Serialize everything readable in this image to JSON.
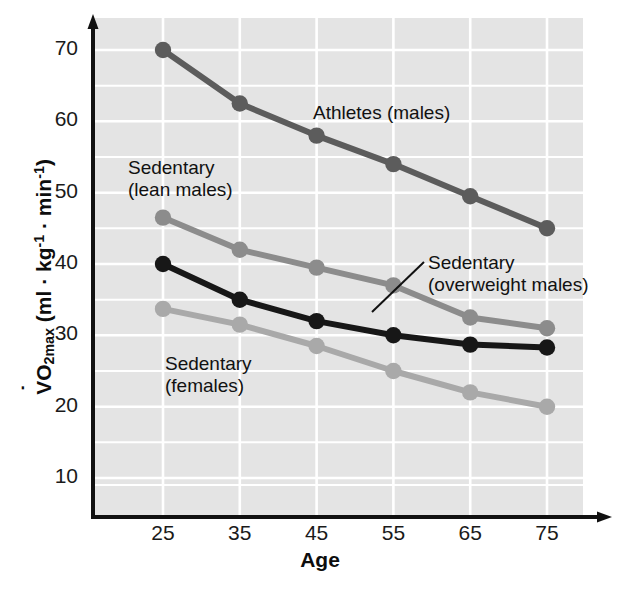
{
  "chart_data": {
    "type": "line",
    "title": "",
    "xlabel": "Age",
    "ylabel": "VO2max (ml · kg-1 · min-1)",
    "ylabel_parts": {
      "v": "V",
      "o": "O",
      "two": "2",
      "max": "max",
      "open": " (ml · kg",
      "sup1": "-1",
      "mid": " · min",
      "sup2": "-1",
      "close": ")"
    },
    "categories": [
      25,
      35,
      45,
      55,
      65,
      75
    ],
    "xtick_labels": [
      "25",
      "35",
      "45",
      "55",
      "65",
      "75"
    ],
    "ytick_labels": [
      "10",
      "20",
      "30",
      "40",
      "50",
      "60",
      "70"
    ],
    "ytick_values": [
      10,
      20,
      30,
      40,
      50,
      60,
      70
    ],
    "xlim": [
      20,
      80
    ],
    "ylim": [
      5,
      74
    ],
    "grid": true,
    "grid_minor_step": 5,
    "legend_position": "inline-annotations",
    "plot_background": "#e4e4e4",
    "grid_color": "#ffffff",
    "axis_color": "#111111",
    "series": [
      {
        "name": "Athletes (males)",
        "color": "#5c5c5c",
        "values": [
          70,
          62.5,
          58,
          54,
          49.5,
          45
        ],
        "label_x": 313,
        "label_y": 102
      },
      {
        "name": "Sedentary\n(lean males)",
        "label_line1": "Sedentary",
        "label_line2": "(lean males)",
        "color": "#8c8c8c",
        "values": [
          46.5,
          42,
          39.5,
          37,
          32.5,
          31
        ],
        "label_x": 128,
        "label_y": 157
      },
      {
        "name": "Sedentary\n(overweight males)",
        "label_line1": "Sedentary",
        "label_line2": "(overweight males)",
        "color": "#171717",
        "values": [
          40,
          35,
          32,
          30,
          28.7,
          28.3
        ],
        "label_x": 428,
        "label_y": 252,
        "leader_from": [
          424,
          262
        ],
        "leader_to": [
          372,
          312
        ]
      },
      {
        "name": "Sedentary\n(females)",
        "label_line1": "Sedentary",
        "label_line2": "(females)",
        "color": "#a9a9a9",
        "values": [
          33.7,
          31.5,
          28.5,
          25,
          22,
          20
        ],
        "label_x": 165,
        "label_y": 353
      }
    ]
  }
}
